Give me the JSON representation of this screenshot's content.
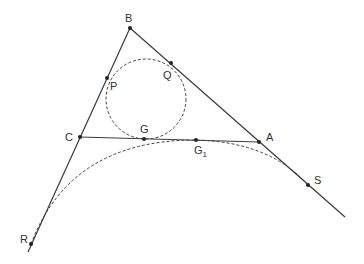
{
  "diagram": {
    "colors": {
      "line": "#3a3a3a",
      "dashed": "#444444",
      "point": "#222222",
      "label": "#333333"
    },
    "points": {
      "A": {
        "label": "A",
        "x": 259,
        "y": 142
      },
      "B": {
        "label": "B",
        "x": 130,
        "y": 28
      },
      "C": {
        "label": "C",
        "x": 80,
        "y": 137
      },
      "P": {
        "label": "P",
        "x": 107,
        "y": 78
      },
      "Q": {
        "label": "Q",
        "x": 171,
        "y": 63
      },
      "G": {
        "label": "G",
        "x": 144,
        "y": 139
      },
      "G1": {
        "label": "G",
        "sub": "1",
        "x": 196,
        "y": 140
      },
      "S": {
        "label": "S",
        "x": 308,
        "y": 185
      },
      "R": {
        "label": "R",
        "x": 31,
        "y": 244
      }
    },
    "incircle": {
      "cx": 146,
      "cy": 99,
      "r": 40
    },
    "labels": {
      "A": "A",
      "B": "B",
      "C": "C",
      "P": "P",
      "Q": "Q",
      "G": "G",
      "G1_main": "G",
      "G1_sub": "1",
      "S": "S",
      "R": "R"
    }
  }
}
